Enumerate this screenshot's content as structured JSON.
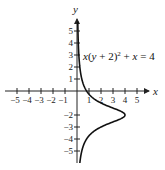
{
  "chart_data": {
    "type": "line",
    "title": "",
    "equation": "x(y + 2)^2 + x = 4",
    "equation_parts": {
      "x1": "x",
      "mid": "(y + 2)",
      "exp": "2",
      "tail": " + x = 4"
    },
    "xlabel": "x",
    "ylabel": "y",
    "xlim": [
      -5,
      5
    ],
    "ylim": [
      -5,
      5
    ],
    "x_ticks": [
      -5,
      -4,
      -3,
      -2,
      -1,
      1,
      2,
      3,
      4,
      5
    ],
    "y_ticks": [
      5,
      4,
      3,
      2,
      1,
      -2,
      -3,
      -4,
      -5
    ],
    "x_tick_labels": [
      "−5",
      "−4",
      "−3",
      "−2",
      "−1",
      "1",
      "2",
      "3",
      "4",
      "5"
    ],
    "y_tick_labels": [
      "5",
      "4",
      "3",
      "2",
      "1",
      "−2",
      "−3",
      "−4",
      "−5"
    ],
    "grid": false,
    "series": [
      {
        "name": "x = 4/((y+2)^2 + 1)",
        "points": [
          {
            "y": 5.8,
            "x": 0.06
          },
          {
            "y": 4,
            "x": 0.108
          },
          {
            "y": 3,
            "x": 0.154
          },
          {
            "y": 2,
            "x": 0.235
          },
          {
            "y": 1,
            "x": 0.4
          },
          {
            "y": 0,
            "x": 0.8
          },
          {
            "y": -1,
            "x": 2.0
          },
          {
            "y": -2,
            "x": 4.0
          },
          {
            "y": -3,
            "x": 2.0
          },
          {
            "y": -4,
            "x": 0.8
          },
          {
            "y": -5,
            "x": 0.4
          },
          {
            "y": -6.2,
            "x": 0.21
          }
        ]
      }
    ]
  }
}
